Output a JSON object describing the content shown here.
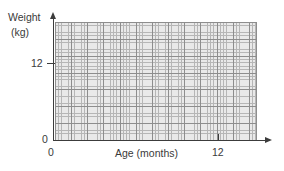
{
  "chart_data": {
    "type": "scatter",
    "title": "",
    "xlabel": "Age (months)",
    "ylabel": "Weight (kg)",
    "ylabel_line1": "Weight",
    "ylabel_line2": "(kg)",
    "xlim": [
      0,
      14.5
    ],
    "ylim": [
      0,
      21
    ],
    "x_ticks": [
      {
        "value": 0,
        "label": "0"
      },
      {
        "value": 12,
        "label": "12"
      }
    ],
    "y_ticks": [
      {
        "value": 0,
        "label": "0"
      },
      {
        "value": 12,
        "label": "12"
      }
    ],
    "grid": true,
    "grid_minor_cells_per_major": 5,
    "grid_minor_columns": 62,
    "grid_minor_rows": 35,
    "legend": "none",
    "series": [],
    "values": [],
    "annotations": [],
    "colors": {
      "axis": "#3c3c3c",
      "text": "#3a3a3a",
      "grid_major": "#8d8d8d",
      "grid_minor": "#b6b6b6",
      "plot_background": "#e9e9e9",
      "page_background": "#ffffff"
    }
  },
  "axes": {
    "y": {
      "title_line1": "Weight",
      "title_line2": "(kg)",
      "tick_12": "12",
      "tick_0": "0",
      "arrow_icon": "arrow-up-icon"
    },
    "x": {
      "title": "Age (months)",
      "tick_0": "0",
      "tick_12": "12",
      "arrow_icon": "arrow-right-icon"
    }
  }
}
